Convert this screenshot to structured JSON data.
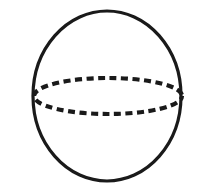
{
  "figure": {
    "kind": "sphere-line-drawing",
    "canvas": {
      "width": 206,
      "height": 193,
      "background_color": "#ffffff"
    },
    "ink_color": "#1a1a1a",
    "shapes": {
      "outline": {
        "name": "sphere-outline",
        "shape": "ellipse",
        "cx": 107,
        "cy": 96,
        "rx": 74,
        "ry": 85,
        "stroke_color": "#1a1a1a",
        "stroke_width": 3.2,
        "fill": "none",
        "dashed": false
      },
      "equator": {
        "name": "equator-ellipse",
        "shape": "ellipse",
        "cx": 108,
        "cy": 96,
        "rx": 74,
        "ry": 18,
        "stroke_color": "#1a1a1a",
        "stroke_width": 4.2,
        "fill": "none",
        "dashed": true,
        "dash_length": 7,
        "dash_gap": 4.5,
        "dash_pattern": "7 4.5",
        "dash_offset": 3
      }
    }
  }
}
